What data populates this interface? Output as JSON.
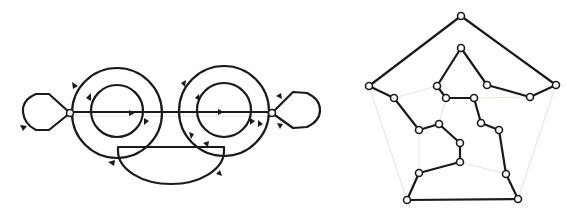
{
  "figure": {
    "panels": [
      {
        "name": "left-panel",
        "description": "Two concentric circle pairs joined by a horizontal edge, with loops at both ends and a lower half-disc face; arrowheads mark orientation",
        "nodes": [
          {
            "id": "L",
            "x": 70,
            "y": 113
          },
          {
            "id": "R",
            "x": 272,
            "y": 113
          }
        ],
        "circles": [
          {
            "id": "left-outer",
            "cx": 117,
            "cy": 113,
            "r": 45
          },
          {
            "id": "left-inner",
            "cx": 117,
            "cy": 111,
            "r": 26
          },
          {
            "id": "right-outer",
            "cx": 224,
            "cy": 111,
            "r": 45
          },
          {
            "id": "right-inner",
            "cx": 224,
            "cy": 110,
            "r": 27
          }
        ],
        "arrow_count": 14
      },
      {
        "name": "right-panel",
        "description": "Planar graph: black cycle path drawn over faint gray pentagonal frame",
        "nodes": [
          {
            "x": 461,
            "y": 16
          },
          {
            "x": 461,
            "y": 48
          },
          {
            "x": 369,
            "y": 86
          },
          {
            "x": 556,
            "y": 85
          },
          {
            "x": 437,
            "y": 86
          },
          {
            "x": 487,
            "y": 85
          },
          {
            "x": 446,
            "y": 98
          },
          {
            "x": 474,
            "y": 98
          },
          {
            "x": 394,
            "y": 98
          },
          {
            "x": 530,
            "y": 97
          },
          {
            "x": 419,
            "y": 130
          },
          {
            "x": 439,
            "y": 124
          },
          {
            "x": 481,
            "y": 123
          },
          {
            "x": 499,
            "y": 130
          },
          {
            "x": 460,
            "y": 143
          },
          {
            "x": 460,
            "y": 162
          },
          {
            "x": 419,
            "y": 173
          },
          {
            "x": 506,
            "y": 174
          },
          {
            "x": 407,
            "y": 200
          },
          {
            "x": 518,
            "y": 199
          }
        ],
        "node_count": 20
      }
    ]
  }
}
